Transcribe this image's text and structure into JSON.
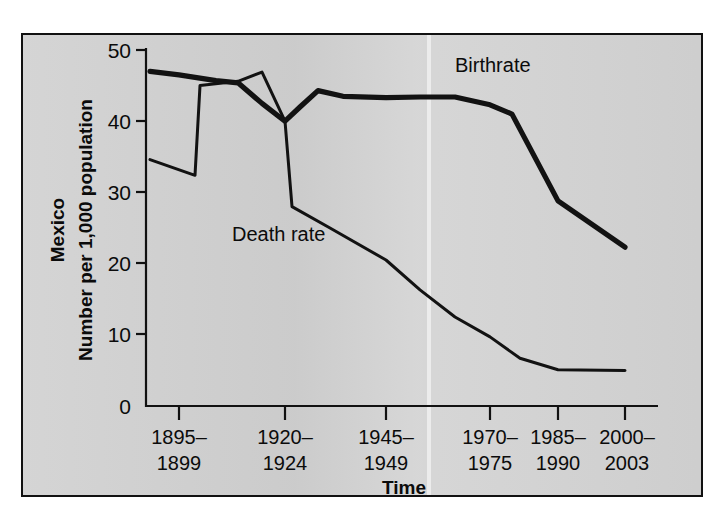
{
  "chart_data": {
    "type": "line",
    "title": "",
    "xlabel": "Time",
    "ylabel": "Number per 1,000 population",
    "region_label": "Mexico",
    "ylim": [
      0,
      50
    ],
    "yticks": [
      0,
      10,
      20,
      30,
      40,
      50
    ],
    "grid": false,
    "legend_position": "inline-annotations",
    "categories": [
      "1895–1899",
      "1920–1924",
      "1945–1949",
      "1970–1975",
      "1985–1990",
      "2000–2003"
    ],
    "x_positions": [
      179,
      285,
      386,
      490,
      558,
      625
    ],
    "series": [
      {
        "name": "Birthrate",
        "label_text": "Birthrate",
        "points": [
          {
            "x": 150,
            "value": 47.0
          },
          {
            "x": 179,
            "value": 46.5
          },
          {
            "x": 216,
            "value": 45.7
          },
          {
            "x": 238,
            "value": 45.4
          },
          {
            "x": 262,
            "value": 42.5
          },
          {
            "x": 285,
            "value": 40.0
          },
          {
            "x": 300,
            "value": 42.0
          },
          {
            "x": 318,
            "value": 44.3
          },
          {
            "x": 343,
            "value": 43.5
          },
          {
            "x": 386,
            "value": 43.3
          },
          {
            "x": 420,
            "value": 43.4
          },
          {
            "x": 455,
            "value": 43.4
          },
          {
            "x": 490,
            "value": 42.3
          },
          {
            "x": 512,
            "value": 41.0
          },
          {
            "x": 558,
            "value": 28.8
          },
          {
            "x": 625,
            "value": 22.3
          }
        ]
      },
      {
        "name": "Death rate",
        "label_text": "Death rate",
        "points": [
          {
            "x": 150,
            "value": 34.6
          },
          {
            "x": 195,
            "value": 32.4
          },
          {
            "x": 200,
            "value": 45.0
          },
          {
            "x": 238,
            "value": 45.6
          },
          {
            "x": 262,
            "value": 46.9
          },
          {
            "x": 285,
            "value": 40.0
          },
          {
            "x": 292,
            "value": 28.0
          },
          {
            "x": 330,
            "value": 25.0
          },
          {
            "x": 386,
            "value": 20.5
          },
          {
            "x": 420,
            "value": 16.3
          },
          {
            "x": 455,
            "value": 12.5
          },
          {
            "x": 490,
            "value": 9.7
          },
          {
            "x": 520,
            "value": 6.7
          },
          {
            "x": 558,
            "value": 5.1
          },
          {
            "x": 625,
            "value": 5.0
          }
        ]
      }
    ],
    "annotations": [
      {
        "text": "Birthrate",
        "x": 455,
        "y": 72
      },
      {
        "text": "Death rate",
        "x": 258,
        "y": 238
      }
    ],
    "colors": {
      "plot_background": "#d2d2d2",
      "page_background": "#ffffff",
      "line": "#121212",
      "axis": "#111111"
    }
  }
}
